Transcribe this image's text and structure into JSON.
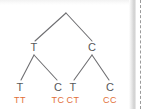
{
  "figure": {
    "colors": {
      "branch": "#6f6f72",
      "node_text": "#58585a",
      "genotype_text": "#e2703a",
      "background": "#ffffff",
      "gutter_shadow": "#cfcfcf",
      "crop_guide": "#9a9a9a"
    }
  },
  "tree": {
    "root": {
      "label": "",
      "x": 66,
      "y": 13
    },
    "level1": [
      {
        "name": "node-t",
        "label": "T",
        "x": 34,
        "y": 48
      },
      {
        "name": "node-c",
        "label": "C",
        "x": 92,
        "y": 48
      }
    ],
    "leaves": [
      {
        "name": "leaf-t-left",
        "label": "T",
        "x": 20,
        "y": 87
      },
      {
        "name": "leaf-c-left",
        "label": "C",
        "x": 58,
        "y": 87
      },
      {
        "name": "leaf-t-right",
        "label": "T",
        "x": 73,
        "y": 87
      },
      {
        "name": "leaf-c-right",
        "label": "C",
        "x": 110,
        "y": 87
      }
    ],
    "genotypes": [
      {
        "name": "genotype-tt",
        "label": "TT",
        "x": 20,
        "y": 100
      },
      {
        "name": "genotype-tc",
        "label": "TC",
        "x": 58,
        "y": 100
      },
      {
        "name": "genotype-ct",
        "label": "CT",
        "x": 73,
        "y": 100
      },
      {
        "name": "genotype-cc",
        "label": "CC",
        "x": 110,
        "y": 100
      }
    ]
  }
}
